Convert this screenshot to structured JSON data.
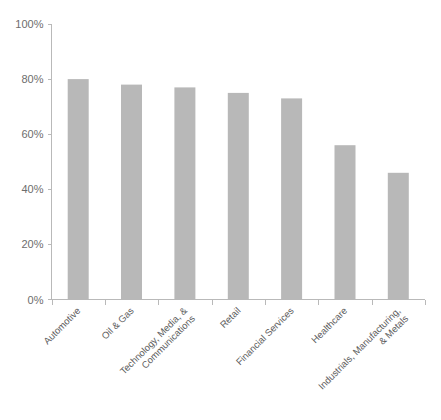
{
  "chart_data": {
    "type": "bar",
    "title": "",
    "subtitle": "",
    "xlabel": "",
    "ylabel": "",
    "ylim": [
      0,
      100
    ],
    "grid": false,
    "legend": false,
    "legend_position": "none",
    "orientation": "vertical",
    "bar_color": "#b8b8b8",
    "axis_color": "#b9b9b9",
    "tick_label_color": "#6d6d6d",
    "category_label_color": "#5d5d5d",
    "background_color": "#ffffff",
    "category_label_rotation": -45,
    "y_ticks": [
      0,
      20,
      40,
      60,
      80,
      100
    ],
    "y_tick_labels": [
      "0%",
      "20%",
      "40%",
      "60%",
      "80%",
      "100%"
    ],
    "categories": [
      "Automotive",
      "Oil & Gas",
      "Technology, Media, & Communications",
      "Retail",
      "Financial Services",
      "Healthcare",
      "Industrials, Manufacturing, & Metals"
    ],
    "category_label_lines": [
      [
        "Automotive"
      ],
      [
        "Oil & Gas"
      ],
      [
        "Technology, Media, &",
        "Communications"
      ],
      [
        "Retail"
      ],
      [
        "Financial Services"
      ],
      [
        "Healthcare"
      ],
      [
        "Industrials, Manufacturing,",
        "& Metals"
      ]
    ],
    "values": [
      80,
      78,
      77,
      75,
      73,
      56,
      46
    ],
    "value_labels": [
      "80%",
      "78%",
      "77%",
      "75%",
      "73%",
      "56%",
      "46%"
    ]
  }
}
